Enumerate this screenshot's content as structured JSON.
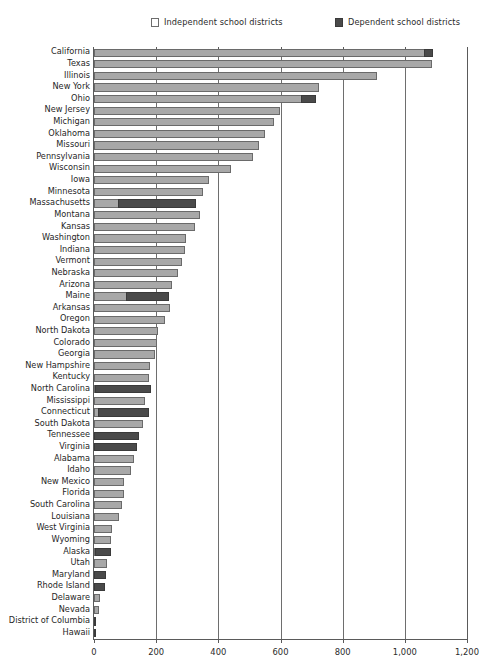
{
  "legend": {
    "independent": "Independent school districts",
    "dependent": "Dependent school districts"
  },
  "axis": {
    "ticks": [
      "0",
      "200",
      "400",
      "600",
      "800",
      "1,000",
      "1,200"
    ]
  },
  "colors": {
    "independent": "#a8a8a8",
    "dependent": "#4a4a4a",
    "axis": "#5a5a5a",
    "background": "#ffffff"
  },
  "chart_data": {
    "type": "bar",
    "orientation": "horizontal",
    "stacked": true,
    "title": "",
    "xlabel": "",
    "ylabel": "",
    "xlim": [
      0,
      1200
    ],
    "xticks": [
      0,
      200,
      400,
      600,
      800,
      1000,
      1200
    ],
    "grid": true,
    "legend_position": "top",
    "categories": [
      "California",
      "Texas",
      "Illinois",
      "New York",
      "Ohio",
      "New Jersey",
      "Michigan",
      "Oklahoma",
      "Missouri",
      "Pennsylvania",
      "Wisconsin",
      "Iowa",
      "Minnesota",
      "Massachusetts",
      "Montana",
      "Kansas",
      "Washington",
      "Indiana",
      "Vermont",
      "Nebraska",
      "Arizona",
      "Maine",
      "Arkansas",
      "Oregon",
      "North Dakota",
      "Colorado",
      "Georgia",
      "New Hampshire",
      "Kentucky",
      "North Carolina",
      "Mississippi",
      "Connecticut",
      "South Dakota",
      "Tennessee",
      "Virginia",
      "Alabama",
      "Idaho",
      "New Mexico",
      "Florida",
      "South Carolina",
      "Louisiana",
      "West Virginia",
      "Wyoming",
      "Alaska",
      "Utah",
      "Maryland",
      "Rhode Island",
      "Delaware",
      "Nevada",
      "District of Columbia",
      "Hawaii"
    ],
    "series": [
      {
        "name": "Independent school districts",
        "values": [
          1065,
          1089,
          912,
          723,
          668,
          599,
          580,
          551,
          530,
          512,
          441,
          371,
          352,
          82,
          340,
          324,
          296,
          294,
          284,
          271,
          250,
          105,
          243,
          230,
          207,
          202,
          196,
          180,
          176,
          1,
          164,
          17,
          158,
          0,
          0,
          130,
          118,
          96,
          95,
          91,
          79,
          57,
          55,
          1,
          41,
          0,
          0,
          19,
          17,
          0,
          0
        ]
      },
      {
        "name": "Dependent school districts",
        "values": [
          28,
          0,
          0,
          0,
          50,
          0,
          0,
          0,
          0,
          0,
          0,
          0,
          0,
          250,
          0,
          0,
          0,
          0,
          0,
          0,
          0,
          140,
          0,
          0,
          0,
          0,
          0,
          0,
          0,
          180,
          0,
          162,
          0,
          145,
          138,
          0,
          0,
          0,
          0,
          0,
          0,
          0,
          0,
          53,
          0,
          39,
          36,
          0,
          0,
          1,
          1
        ]
      }
    ]
  }
}
